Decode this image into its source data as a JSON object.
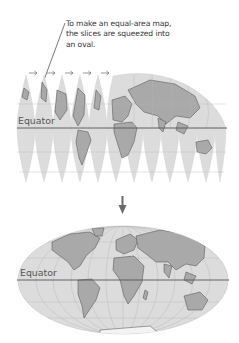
{
  "caption": {
    "lines": [
      "To make an equal-area map,",
      "the slices are squeezed into",
      "an oval."
    ]
  },
  "top_map": {
    "equator_label": "Equator",
    "gore_count": 12,
    "separated_gores_with_arrows": 5,
    "arrow_glyph": "→"
  },
  "transition_arrow": {
    "direction": "down",
    "icon": "down-arrow-icon"
  },
  "bottom_map": {
    "equator_label": "Equator",
    "projection": "equal-area oval"
  },
  "colors": {
    "ocean": "#dcdcdc",
    "land": "#a9a9a9",
    "coast": "#4a4a4a",
    "grid": "#bdbdbd",
    "equator_line": "#555555",
    "arrow": "#6a6a6a",
    "text": "#333333"
  }
}
